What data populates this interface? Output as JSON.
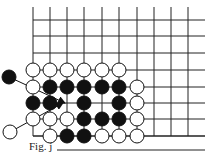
{
  "figure": {
    "caption": "Fig. j",
    "board": {
      "columns_x": [
        33,
        50,
        67,
        84,
        102,
        119,
        137,
        154,
        171,
        188
      ],
      "rows_y": [
        20,
        36,
        53,
        70,
        87,
        103,
        119,
        136
      ],
      "line_top": 7,
      "line_right": 205,
      "left_edge_col": 0,
      "bottom_edge_row": 7,
      "line_color": "#222222"
    },
    "stones": [
      {
        "color": "white",
        "col": 0,
        "row": 3
      },
      {
        "color": "white",
        "col": 1,
        "row": 3
      },
      {
        "color": "white",
        "col": 2,
        "row": 3
      },
      {
        "color": "white",
        "col": 3,
        "row": 3
      },
      {
        "color": "white",
        "col": 4,
        "row": 3
      },
      {
        "color": "white",
        "col": 5,
        "row": 3
      },
      {
        "color": "white",
        "col": 0,
        "row": 4
      },
      {
        "color": "black",
        "col": 1,
        "row": 4
      },
      {
        "color": "black",
        "col": 2,
        "row": 4
      },
      {
        "color": "black",
        "col": 3,
        "row": 4
      },
      {
        "color": "black",
        "col": 4,
        "row": 4
      },
      {
        "color": "black",
        "col": 5,
        "row": 4
      },
      {
        "color": "white",
        "col": 6,
        "row": 4
      },
      {
        "color": "black",
        "col": 0,
        "row": 5
      },
      {
        "color": "black",
        "col": 1,
        "row": 5
      },
      {
        "color": "black",
        "col": 3,
        "row": 5
      },
      {
        "color": "black",
        "col": 5,
        "row": 5
      },
      {
        "color": "white",
        "col": 6,
        "row": 5
      },
      {
        "color": "white",
        "col": 0,
        "row": 6
      },
      {
        "color": "white",
        "col": 1,
        "row": 6
      },
      {
        "color": "white",
        "col": 2,
        "row": 6
      },
      {
        "color": "black",
        "col": 3,
        "row": 6
      },
      {
        "color": "black",
        "col": 4,
        "row": 6
      },
      {
        "color": "black",
        "col": 5,
        "row": 6
      },
      {
        "color": "white",
        "col": 6,
        "row": 6
      },
      {
        "color": "white",
        "col": 1,
        "row": 7
      },
      {
        "color": "black",
        "col": 2,
        "row": 7
      },
      {
        "color": "black",
        "col": 3,
        "row": 7
      },
      {
        "color": "white",
        "col": 4,
        "row": 7
      },
      {
        "color": "white",
        "col": 5,
        "row": 7
      },
      {
        "color": "white",
        "col": 6,
        "row": 7
      }
    ],
    "outside_stones": [
      {
        "color": "black",
        "x": 9,
        "y": 77,
        "arrow_to": [
          65,
          103
        ]
      },
      {
        "color": "white",
        "x": 10,
        "y": 132,
        "arrow_to": [
          63,
          103
        ]
      }
    ],
    "caption_rule": {
      "x1": 57,
      "x2": 205,
      "y": 150
    },
    "stone_radius": 7
  }
}
